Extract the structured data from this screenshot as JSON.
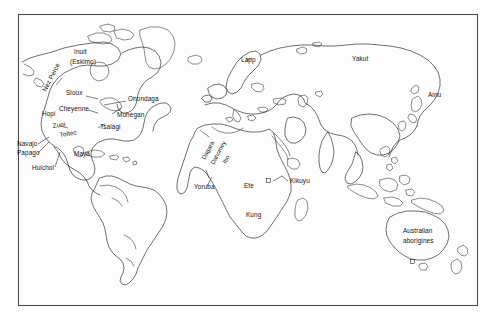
{
  "figure": {
    "kind": "world-map",
    "title_visible": false,
    "background_color": "#fdfdfd",
    "outline_color": "#1a1a1a",
    "frame_color": "#4d4d4d",
    "label_color": "#141414"
  },
  "labels": [
    {
      "id": "inuit",
      "text": "Inuit",
      "region": "north-america",
      "x": 74,
      "y": 54,
      "rotation": 0
    },
    {
      "id": "eskimo",
      "text": "(Eskimo)",
      "region": "north-america",
      "x": 70,
      "y": 64,
      "rotation": 0
    },
    {
      "id": "nez-perce",
      "text": "Nez Perce",
      "region": "north-america",
      "x": 46,
      "y": 92,
      "rotation": -63
    },
    {
      "id": "sioux",
      "text": "Sioux",
      "region": "north-america",
      "x": 66,
      "y": 95,
      "rotation": 0
    },
    {
      "id": "cheyenne",
      "text": "Cheyenne",
      "region": "north-america",
      "x": 59,
      "y": 111,
      "rotation": 0
    },
    {
      "id": "hopi",
      "text": "Hopi",
      "region": "north-america",
      "x": 42,
      "y": 116,
      "rotation": 0
    },
    {
      "id": "zuni",
      "text": "Zuni",
      "region": "north-america",
      "x": 53,
      "y": 128,
      "rotation": -8
    },
    {
      "id": "toltec",
      "text": "Toltec",
      "region": "central-america",
      "x": 60,
      "y": 137,
      "rotation": -8
    },
    {
      "id": "navajo",
      "text": "Navajo",
      "region": "north-america",
      "x": 17,
      "y": 146,
      "rotation": 0
    },
    {
      "id": "papago",
      "text": "Papago",
      "region": "north-america",
      "x": 17,
      "y": 155,
      "rotation": 0
    },
    {
      "id": "huichol",
      "text": "Huichol",
      "region": "central-america",
      "x": 32,
      "y": 170,
      "rotation": 0
    },
    {
      "id": "maya",
      "text": "Maya",
      "region": "central-america",
      "x": 74,
      "y": 156,
      "rotation": 0
    },
    {
      "id": "onondaga",
      "text": "Onondaga",
      "region": "north-america",
      "x": 128,
      "y": 101,
      "rotation": 0
    },
    {
      "id": "mohegan",
      "text": "Mohegan",
      "region": "north-america",
      "x": 117,
      "y": 117,
      "rotation": 0
    },
    {
      "id": "tsalagi",
      "text": "Tsalagi",
      "region": "north-america",
      "x": 100,
      "y": 129,
      "rotation": 0
    },
    {
      "id": "lapp",
      "text": "Lapp",
      "region": "northern-europe",
      "x": 241,
      "y": 62,
      "rotation": 0
    },
    {
      "id": "yakut",
      "text": "Yakut",
      "region": "siberia",
      "x": 352,
      "y": 61,
      "rotation": 0
    },
    {
      "id": "ainu",
      "text": "Ainu",
      "region": "japan",
      "x": 428,
      "y": 97,
      "rotation": 0
    },
    {
      "id": "dagara",
      "text": "Dagara",
      "region": "west-africa",
      "x": 205,
      "y": 160,
      "rotation": -62
    },
    {
      "id": "dahomey",
      "text": "Dahomey",
      "region": "west-africa",
      "x": 214,
      "y": 165,
      "rotation": -62
    },
    {
      "id": "ibo",
      "text": "Ibo",
      "region": "west-africa",
      "x": 226,
      "y": 164,
      "rotation": -62
    },
    {
      "id": "yoruba",
      "text": "Yoruba",
      "region": "west-africa",
      "x": 194,
      "y": 189,
      "rotation": 0
    },
    {
      "id": "efe",
      "text": "Efe",
      "region": "central-africa",
      "x": 244,
      "y": 188,
      "rotation": 0
    },
    {
      "id": "kikuyu",
      "text": "Kikuyu",
      "region": "east-africa",
      "x": 290,
      "y": 183,
      "rotation": 0
    },
    {
      "id": "kung",
      "text": "Kung",
      "region": "southern-africa",
      "x": 246,
      "y": 217,
      "rotation": 0
    },
    {
      "id": "aus-line1",
      "text": "Australian",
      "region": "australia",
      "x": 403,
      "y": 233,
      "rotation": 0
    },
    {
      "id": "aus-line2",
      "text": "aborigines",
      "region": "australia",
      "x": 403,
      "y": 243,
      "rotation": 0
    }
  ],
  "markers": [
    {
      "id": "kikuyu-marker",
      "shape": "square",
      "x": 269,
      "y": 181,
      "leader_to_label": "kikuyu"
    },
    {
      "id": "tasmania-marker",
      "shape": "square",
      "x": 412,
      "y": 262,
      "leader_to_label": null
    }
  ],
  "frame": {
    "x": 18,
    "y": 14,
    "width": 460,
    "height": 292
  }
}
